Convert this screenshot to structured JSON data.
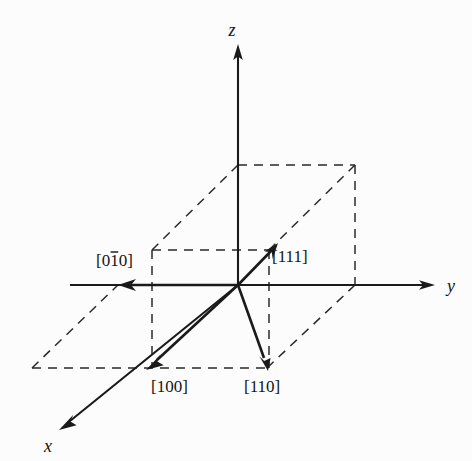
{
  "figure": {
    "background_color": "#fcfcfc",
    "line_color": "#1a1a1a",
    "dash_color": "#2a2a2a",
    "width": 472,
    "height": 461
  },
  "axes": [
    {
      "id": "z",
      "label": "z",
      "label_x": 232,
      "label_y": 36,
      "from_x": 238,
      "from_y": 285,
      "to_x": 238,
      "to_y": 52
    },
    {
      "id": "y",
      "label": "y",
      "label_x": 447,
      "label_y": 292,
      "from_x": 118,
      "from_y": 285,
      "to_x": 428,
      "to_y": 285
    },
    {
      "id": "x",
      "label": "x",
      "label_x": 44,
      "label_y": 452,
      "from_x": 238,
      "from_y": 285,
      "to_x": 66,
      "to_y": 424
    }
  ],
  "vectors": [
    {
      "id": "111",
      "label": "[111]",
      "overbar_index": null,
      "label_x": 272,
      "label_y": 262,
      "from_x": 238,
      "from_y": 285,
      "to_x": 270,
      "to_y": 246
    },
    {
      "id": "110",
      "label": "[110]",
      "overbar_index": null,
      "label_x": 244,
      "label_y": 392,
      "from_x": 238,
      "from_y": 285,
      "to_x": 267,
      "to_y": 366
    },
    {
      "id": "100",
      "label": "[100]",
      "overbar_index": null,
      "label_x": 151,
      "label_y": 392,
      "from_x": 238,
      "from_y": 285,
      "to_x": 149,
      "to_y": 366
    },
    {
      "id": "0-10",
      "label": "[010]",
      "overbar_index": 1,
      "label_x": 96,
      "label_y": 266,
      "from_x": 238,
      "from_y": 285,
      "to_x": 122,
      "to_y": 285
    }
  ],
  "cube": {
    "description": "unit cell drawn with dashed construction lines",
    "vertices": {
      "origin": [
        238,
        285
      ],
      "y_front_right": [
        355,
        285
      ],
      "x_back_left": [
        152,
        250
      ],
      "back_right": [
        269,
        250
      ],
      "x_front_left": [
        120,
        368
      ],
      "bottom_front_right": [
        267,
        368
      ],
      "bottom_far_left": [
        32,
        368
      ],
      "bottom_far_right": [
        149,
        368
      ],
      "top_origin": [
        238,
        165
      ],
      "top_y_right": [
        355,
        165
      ],
      "top_back_left": [
        152,
        165
      ],
      "top_back_right": [
        269,
        165
      ]
    }
  },
  "chart_data": {
    "type": "diagram",
    "subtype": "3d-vector-diagram",
    "axis_labels": [
      "x",
      "y",
      "z"
    ],
    "direction_indices": [
      {
        "label": "[111]",
        "miller": [
          1,
          1,
          1
        ],
        "description": "body diagonal of the unit cell"
      },
      {
        "label": "[110]",
        "miller": [
          1,
          1,
          0
        ],
        "description": "face diagonal in the x-y plane"
      },
      {
        "label": "[100]",
        "miller": [
          1,
          0,
          0
        ],
        "description": "along the positive x axis"
      },
      {
        "label": "[010]",
        "miller": [
          0,
          -1,
          0
        ],
        "description": "along the negative y axis, bar over the 1"
      }
    ],
    "grid": false,
    "legend": "none"
  }
}
